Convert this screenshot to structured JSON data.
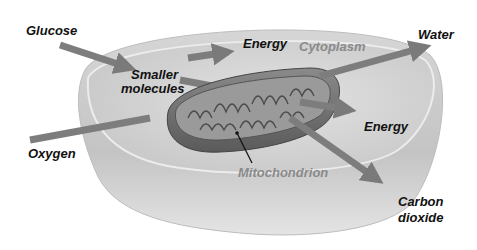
{
  "diagram": {
    "title_hidden": "Cellular respiration in a cell",
    "colors": {
      "background": "#ffffff",
      "cell_outer": "#cfcfcf",
      "cell_rim": "#e6e6e6",
      "cell_inner": "#d9d9d9",
      "mitochondrion": "#6e6e6e",
      "arrow": "#7d7d7d",
      "label_dark": "#111111",
      "label_gray": "#8a8a8a"
    },
    "labels": {
      "glucose": "Glucose",
      "smaller_molecules_line1": "Smaller",
      "smaller_molecules_line2": "molecules",
      "energy_top": "Energy",
      "cytoplasm": "Cytoplasm",
      "water": "Water",
      "energy_right": "Energy",
      "oxygen": "Oxygen",
      "mitochondrion": "Mitochondrion",
      "carbon_dioxide_line1": "Carbon",
      "carbon_dioxide_line2": "dioxide"
    },
    "arrows": [
      {
        "name": "glucose-arrow",
        "from": "Glucose",
        "to": "Smaller molecules"
      },
      {
        "name": "energy-top-arrow",
        "from": "Smaller molecules",
        "to": "Energy"
      },
      {
        "name": "molecules-to-mito-arrow",
        "from": "Smaller molecules",
        "to": "Mitochondrion"
      },
      {
        "name": "oxygen-arrow",
        "from": "Oxygen",
        "to": "Mitochondrion"
      },
      {
        "name": "water-arrow",
        "from": "Mitochondrion",
        "to": "Water"
      },
      {
        "name": "energy-right-arrow",
        "from": "Mitochondrion",
        "to": "Energy"
      },
      {
        "name": "carbon-dioxide-arrow",
        "from": "Mitochondrion",
        "to": "Carbon dioxide"
      }
    ]
  }
}
